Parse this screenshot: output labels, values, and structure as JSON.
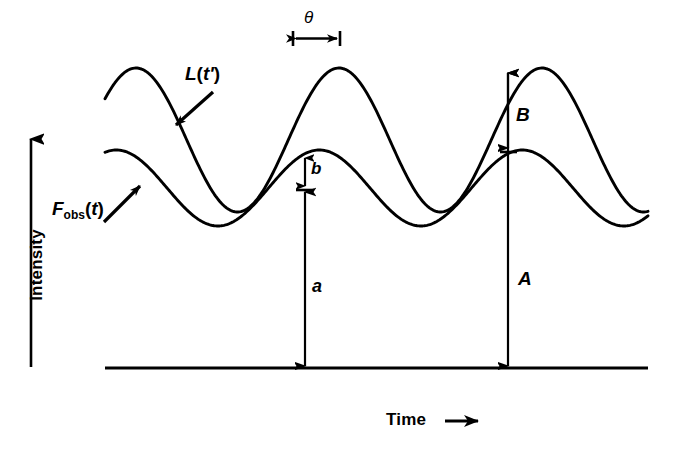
{
  "figure": {
    "background_color": "#ffffff",
    "stroke_color": "#000000",
    "axes": {
      "y_axis_label": "Intensity",
      "y_axis_arrow": "up-arrow-icon",
      "x_axis_label": "Time",
      "x_axis_arrow": "right-arrow-icon",
      "baseline_y": 368,
      "baseline_x_start": 105,
      "baseline_x_end": 648
    },
    "curves": [
      {
        "name": "L(t')",
        "label_main": "L",
        "label_paren_open": "(",
        "label_var": "t'",
        "label_paren_close": ")",
        "description": "intrinsic luminosity curve, large amplitude",
        "amplitude": 72,
        "mean_level": 140,
        "period": 203,
        "phase_deg": 55
      },
      {
        "name": "F_obs(t)",
        "label_main": "F",
        "label_sub": "obs",
        "label_paren_open": "(",
        "label_var": "t",
        "label_paren_close": ")",
        "description": "observed flux curve, small amplitude, phase lagged",
        "amplitude": 38,
        "mean_level": 188,
        "period": 203,
        "phase_deg": 20
      }
    ],
    "markers": [
      {
        "id": "theta",
        "label": "θ",
        "type": "horizontal-double-arrow",
        "x_start": 293,
        "x_end": 340,
        "y": 38,
        "meaning": "phase lag between the two curves"
      },
      {
        "id": "a",
        "label": "a",
        "type": "vertical-double-arrow",
        "x": 305,
        "y_top": 156,
        "y_bottom": 368,
        "meaning": "F_obs peak height above baseline"
      },
      {
        "id": "b",
        "label": "b",
        "type": "vertical-double-arrow",
        "x": 305,
        "y_top": 156,
        "y_bottom": 190,
        "meaning": "F_obs amplitude"
      },
      {
        "id": "A",
        "label": "A",
        "type": "vertical-double-arrow",
        "x": 508,
        "y_top": 71,
        "y_bottom": 368,
        "meaning": "L peak height above baseline"
      },
      {
        "id": "B",
        "label": "B",
        "type": "vertical-double-arrow",
        "x": 508,
        "y_top": 71,
        "y_bottom": 152,
        "meaning": "L amplitude above F_obs peak"
      }
    ]
  },
  "chart_data": {
    "type": "line",
    "title": "",
    "xlabel": "Time",
    "ylabel": "Intensity",
    "grid": false,
    "legend": "inline-annotations",
    "axis_ticks": [],
    "annotations": [
      "θ",
      "a",
      "b",
      "A",
      "B",
      "L(t')",
      "F_obs(t)"
    ],
    "series": [
      {
        "name": "L(t')",
        "waveform": "sinusoid",
        "amplitude": 72,
        "mean_level": 140,
        "period": 203,
        "phase_deg": 55,
        "peaks_x": [
          142,
          345,
          548
        ],
        "troughs_x": [
          243,
          446,
          649
        ]
      },
      {
        "name": "F_obs(t)",
        "waveform": "sinusoid",
        "amplitude": 38,
        "mean_level": 188,
        "period": 203,
        "phase_deg": 20,
        "peaks_x": [
          102,
          305,
          508
        ],
        "troughs_x": [
          203,
          406,
          609
        ]
      }
    ]
  }
}
